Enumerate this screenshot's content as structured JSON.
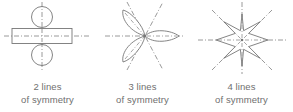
{
  "figures": [
    {
      "id": "two-lines-figure",
      "shape_name": "rectangle-with-two-circles",
      "lines_count": 2,
      "caption_line_1": "2 lines",
      "caption_line_2": "of symmetry",
      "symmetry_axes_degrees": [
        0,
        90
      ],
      "shape_color": "#777777",
      "axis_color": "#8f8f8f",
      "caption_color": "#6f6f6f"
    },
    {
      "id": "three-lines-figure",
      "shape_name": "three-petal-flower",
      "lines_count": 3,
      "caption_line_1": "3 lines",
      "caption_line_2": "of symmetry",
      "symmetry_axes_degrees": [
        0,
        60,
        120
      ],
      "shape_color": "#777777",
      "axis_color": "#8f8f8f",
      "caption_color": "#6f6f6f"
    },
    {
      "id": "four-lines-figure",
      "shape_name": "eight-pointed-star",
      "lines_count": 4,
      "caption_line_1": "4 lines",
      "caption_line_2": "of symmetry",
      "symmetry_axes_degrees": [
        0,
        45,
        90,
        135
      ],
      "shape_color": "#777777",
      "axis_color": "#8f8f8f",
      "caption_color": "#6f6f6f"
    }
  ]
}
